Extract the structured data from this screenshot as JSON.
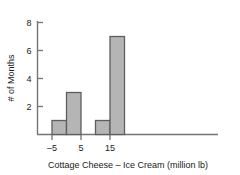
{
  "chart_data": {
    "type": "bar",
    "title": "",
    "subtitle": "",
    "xlabel": "Cottage Cheese – Ice Cream (million lb)",
    "ylabel": "# of Months",
    "xlim": [
      -10,
      21
    ],
    "ylim": [
      0,
      8.6
    ],
    "grid": false,
    "legend": false,
    "legend_position": "none",
    "bin_width": 5,
    "bars": [
      {
        "bin_start": -5,
        "bin_end": 0,
        "value": 1
      },
      {
        "bin_start": 0,
        "bin_end": 5,
        "value": 3
      },
      {
        "bin_start": 10,
        "bin_end": 15,
        "value": 1
      },
      {
        "bin_start": 15,
        "bin_end": 20,
        "value": 7
      }
    ],
    "categories": [
      "-5 to 0",
      "0 to 5",
      "10 to 15",
      "15 to 20"
    ],
    "values": [
      1,
      3,
      1,
      7
    ],
    "xticks": [
      {
        "value": -5,
        "label": "–5"
      },
      {
        "value": 5,
        "label": "5"
      },
      {
        "value": 15,
        "label": "15"
      }
    ],
    "yticks": [
      {
        "value": 2,
        "label": "2"
      },
      {
        "value": 4,
        "label": "4"
      },
      {
        "value": 6,
        "label": "6"
      },
      {
        "value": 8,
        "label": "8"
      }
    ],
    "colors": {
      "bar_fill": "#b5b5b5",
      "bar_border": "#5e5e5e",
      "axis": "#757575",
      "text": "#1a1a1a",
      "background": "#ffffff"
    }
  }
}
